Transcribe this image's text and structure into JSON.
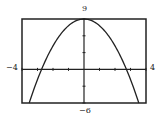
{
  "chart_data": {
    "type": "line",
    "title": "",
    "xlabel": "",
    "ylabel": "",
    "xlim": [
      -4,
      4
    ],
    "ylim": [
      -6,
      9
    ],
    "x_tick_step": 1,
    "y_tick_step": 3,
    "grid": false,
    "legend": null,
    "window_labels": {
      "xmin": "−4",
      "xmax": "4",
      "ymin": "−6",
      "ymax": "9"
    },
    "series": [
      {
        "name": "parabola",
        "description": "Downward-opening parabola, vertex at (0, 9), x-intercepts near ±2.7",
        "x": [
          -3.55,
          -3,
          -2.5,
          -2,
          -1.5,
          -1,
          -0.5,
          0,
          0.5,
          1,
          1.5,
          2,
          2.5,
          3,
          3.55
        ],
        "y": [
          -6.1,
          -1.8,
          1.5,
          4.2,
          6.3,
          7.8,
          8.7,
          9,
          8.7,
          7.8,
          6.3,
          4.2,
          1.5,
          -1.8,
          -6.1
        ]
      }
    ]
  },
  "colors": {
    "frame": "#222222",
    "curve": "#222222",
    "axes": "#222222",
    "background": "#ffffff"
  }
}
